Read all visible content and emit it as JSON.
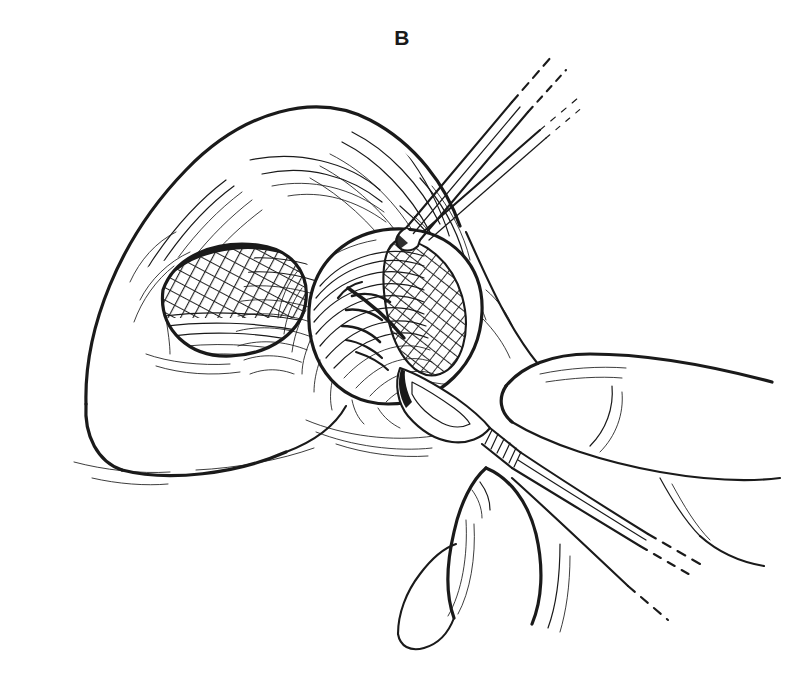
{
  "figure": {
    "panel_label": "B",
    "domain": "medical-line-art",
    "style": "black ink line drawing on white background",
    "background_color": "#ffffff",
    "ink_color": "#1a1a1a",
    "canvas": {
      "width": 804,
      "height": 675
    }
  },
  "anatomy": {
    "structures": [
      {
        "name": "nasal-dorsum",
        "label": "Nasal dorsum / tip",
        "shading": "fine parallel contour hatching"
      },
      {
        "name": "left-nostril",
        "label": "Left nostril (nasal vestibule)",
        "shading": "dense cross-hatching"
      },
      {
        "name": "right-nostril",
        "label": "Right nostril, retracted",
        "shading": "parallel curved hatching with cross-hatched recess"
      },
      {
        "name": "columella",
        "label": "Columella",
        "shading": "horizontal hatching"
      },
      {
        "name": "alar-rim",
        "label": "Alar rim",
        "shading": "contour outline"
      },
      {
        "name": "vestibular-vessels",
        "label": "Vestibular branching markings",
        "shading": "solid dark strokes"
      },
      {
        "name": "upper-lip",
        "label": "Upper lip / nasal base",
        "shading": "light contour strokes"
      }
    ]
  },
  "instruments": [
    {
      "name": "double-prong-retractor",
      "label": "Double-prong skin hook retractor",
      "orientation": "entering from upper right, tip at right nostril rim",
      "tip_location": "right nostril rim",
      "has_dashed_continuation": true
    },
    {
      "name": "scalpel",
      "label": "Scalpel (No. 15 blade)",
      "orientation": "entering from lower right, blade at incision site",
      "handle_detail": "knurled / ribbed handle neck",
      "has_dashed_continuation": true
    }
  ],
  "hand": {
    "name": "surgeon-hand",
    "label": "Surgeon's hand holding scalpel",
    "digits": [
      {
        "name": "index-finger",
        "label": "Index finger"
      },
      {
        "name": "thumb",
        "label": "Thumb"
      }
    ],
    "grip": "pencil grip on scalpel handle"
  }
}
